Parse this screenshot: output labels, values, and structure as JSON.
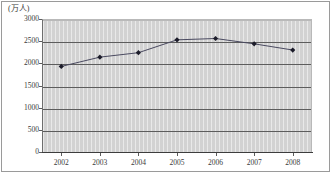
{
  "figure": {
    "unit_label": "(万人)",
    "background_color": "#ffffff",
    "plot_background_color": "#d2d2d2",
    "frame_color": "#9a9a9a",
    "gridline_color": "#5d5d5d",
    "series_color": "#4a4a60",
    "marker_color": "#1c1c2a"
  },
  "chart_data": {
    "type": "line",
    "title": "",
    "subtitle": "",
    "xlabel": "",
    "ylabel": "(万人)",
    "categories": [
      "2002",
      "2003",
      "2004",
      "2005",
      "2006",
      "2007",
      "2008"
    ],
    "values": [
      1930,
      2140,
      2240,
      2530,
      2560,
      2440,
      2300
    ],
    "series": [
      {
        "name": "",
        "values": [
          1930,
          2140,
          2240,
          2530,
          2560,
          2440,
          2300
        ]
      }
    ],
    "ylim": [
      0,
      3000
    ],
    "yticks": [
      0,
      500,
      1000,
      1500,
      2000,
      2500,
      3000
    ],
    "ytick_labels": [
      "0",
      "500",
      "1000",
      "1500",
      "2000",
      "2500",
      "3000"
    ],
    "xtick_labels": [
      "2002",
      "2003",
      "2004",
      "2005",
      "2006",
      "2007",
      "2008"
    ],
    "grid": "horizontal",
    "legend": "none",
    "markers": "diamond",
    "annotations": []
  }
}
